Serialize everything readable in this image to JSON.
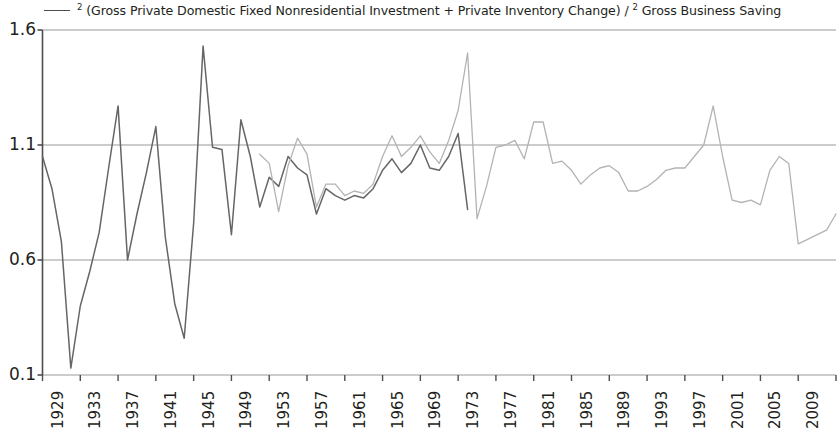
{
  "legend": {
    "swatch_name": "series-line-swatch",
    "label_prefix": "2",
    "label_main": " (Gross Private Domestic Fixed Nonresidential Investment + Private Inventory Change) / ",
    "label_sup2": "2",
    "label_tail": " Gross Business Saving",
    "full_label": "² (Gross Private Domestic Fixed Nonresidential Investment + Private Inventory Change) / ² Gross Business Saving"
  },
  "chart_data": {
    "type": "line",
    "title": "",
    "subtitle": "",
    "xlabel": "",
    "ylabel": "",
    "xlim": [
      1929,
      2013
    ],
    "ylim": [
      0.1,
      1.6
    ],
    "grid": true,
    "legend_position": "top",
    "y_ticks": [
      "1.6",
      "1.1",
      "0.6",
      "0.1"
    ],
    "y_tick_values": [
      1.6,
      1.1,
      0.6,
      0.1
    ],
    "x_ticks": [
      "1929",
      "1933",
      "1937",
      "1941",
      "1945",
      "1949",
      "1953",
      "1957",
      "1961",
      "1965",
      "1969",
      "1973",
      "1977",
      "1981",
      "1985",
      "1989",
      "1993",
      "1997",
      "2001",
      "2005",
      "2009",
      "2013"
    ],
    "x_tick_values": [
      1929,
      1933,
      1937,
      1941,
      1945,
      1949,
      1953,
      1957,
      1961,
      1965,
      1969,
      1973,
      1977,
      1981,
      1985,
      1989,
      1993,
      1997,
      2001,
      2005,
      2009,
      2013
    ],
    "colors": {
      "series_dark": "#666666",
      "series_light": "#b3b3b3",
      "axis": "#4d4d4d",
      "grid": "#999999",
      "background": "#ffffff"
    },
    "series": [
      {
        "name": "2 (Gross Private Domestic Fixed Nonresidential Investment + Private Inventory Change) / 2 Gross Business Saving",
        "color": "#666666",
        "x": [
          1929,
          1930,
          1931,
          1932,
          1933,
          1934,
          1935,
          1936,
          1937,
          1938,
          1939,
          1940,
          1941,
          1942,
          1943,
          1944,
          1945,
          1946,
          1947,
          1948,
          1949,
          1950,
          1951,
          1952,
          1953,
          1954,
          1955,
          1956,
          1957,
          1958,
          1959,
          1960,
          1961,
          1962,
          1963,
          1964,
          1965,
          1966,
          1967,
          1968,
          1969,
          1970,
          1971,
          1972,
          1973,
          1974
        ],
        "y": [
          1.05,
          0.91,
          0.68,
          0.13,
          0.4,
          0.55,
          0.72,
          1.0,
          1.27,
          0.6,
          0.8,
          0.98,
          1.18,
          0.7,
          0.41,
          0.26,
          0.76,
          1.53,
          1.09,
          1.08,
          0.71,
          1.21,
          1.05,
          0.83,
          0.96,
          0.92,
          1.05,
          1.0,
          0.97,
          0.8,
          0.91,
          0.88,
          0.86,
          0.88,
          0.87,
          0.91,
          0.99,
          1.04,
          0.98,
          1.02,
          1.1,
          1.0,
          0.99,
          1.05,
          1.15,
          0.82
        ]
      },
      {
        "name": "2 (Gross Private Domestic Fixed Nonresidential Investment + Private Inventory Change) / 2 Gross Business Saving",
        "color": "#b3b3b3",
        "x": [
          1952,
          1953,
          1954,
          1955,
          1956,
          1957,
          1958,
          1959,
          1960,
          1961,
          1962,
          1963,
          1964,
          1965,
          1966,
          1967,
          1968,
          1969,
          1970,
          1971,
          1972,
          1973,
          1974,
          1975,
          1976,
          1977,
          1978,
          1979,
          1980,
          1981,
          1982,
          1983,
          1984,
          1985,
          1986,
          1987,
          1988,
          1989,
          1990,
          1991,
          1992,
          1993,
          1994,
          1995,
          1996,
          1997,
          1998,
          1999,
          2000,
          2001,
          2002,
          2003,
          2004,
          2005,
          2006,
          2007,
          2008,
          2009,
          2010,
          2011,
          2012,
          2013
        ],
        "y": [
          1.06,
          1.02,
          0.81,
          1.01,
          1.13,
          1.06,
          0.83,
          0.93,
          0.93,
          0.88,
          0.9,
          0.89,
          0.93,
          1.05,
          1.14,
          1.05,
          1.09,
          1.14,
          1.07,
          1.02,
          1.12,
          1.25,
          1.5,
          0.78,
          0.92,
          1.09,
          1.1,
          1.12,
          1.04,
          1.2,
          1.2,
          1.02,
          1.03,
          0.99,
          0.93,
          0.97,
          1.0,
          1.01,
          0.98,
          0.9,
          0.9,
          0.92,
          0.95,
          0.99,
          1.0,
          1.0,
          1.05,
          1.1,
          1.27,
          1.05,
          0.86,
          0.85,
          0.86,
          0.84,
          0.99,
          1.05,
          1.02,
          0.67,
          0.69,
          0.71,
          0.73,
          0.8
        ]
      }
    ]
  }
}
